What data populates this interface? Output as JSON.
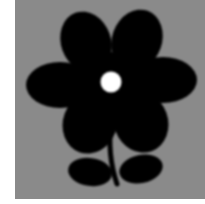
{
  "image": {
    "description": "Black flower silhouette with six petals, white circular center, curved stem and two leaves on a gray square background",
    "colors": {
      "page_background": "#ffffff",
      "square_background": "#8a8a8a",
      "flower": "#000000",
      "center": "#ffffff"
    },
    "flower": {
      "petal_count": 6,
      "leaf_count": 2
    }
  }
}
